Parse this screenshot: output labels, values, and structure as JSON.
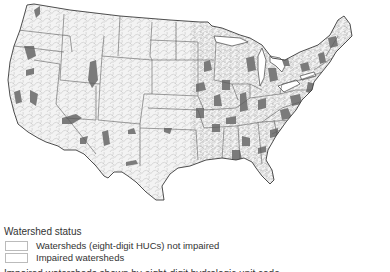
{
  "map": {
    "title": "Watershed status map of contiguous United States",
    "colors": {
      "background": "#ffffff",
      "land": "#f2f2f2",
      "watershed_line": "#b5b5b5",
      "state_line": "#555555",
      "impaired": "#7a7a7a",
      "coast": "#333333"
    }
  },
  "legend": {
    "title": "Watershed status",
    "items": [
      {
        "label": "Watersheds (eight-digit HUCs) not impaired",
        "color": "#ffffff"
      },
      {
        "label": "Impaired watersheds",
        "color": "#ffffff"
      }
    ]
  },
  "caption_cut": "Impaired watersheds shown by eight-digit hydrologic unit code"
}
